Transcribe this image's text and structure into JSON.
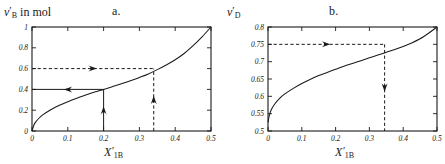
{
  "figure": {
    "width": 445,
    "height": 164,
    "background": "#ffffff",
    "line_color": "#1a1a1a"
  },
  "panels": [
    {
      "letter": "a.",
      "ylabel_symbol": "ν",
      "ylabel_sub": "B",
      "ylabel_suffix": " in mol",
      "xlabel_symbol": "X",
      "xlabel_sub": "1B"
    },
    {
      "letter": "b.",
      "ylabel_symbol": "ν",
      "ylabel_sub": "D",
      "ylabel_suffix": "",
      "xlabel_symbol": "X",
      "xlabel_sub": "1B"
    }
  ],
  "chart_data": [
    {
      "type": "line",
      "title": "a.",
      "xlabel": "X'_1B",
      "ylabel": "ν'_B in mol",
      "xlim": [
        0,
        0.5
      ],
      "ylim": [
        0,
        1
      ],
      "xticks": [
        0,
        0.1,
        0.2,
        0.3,
        0.4,
        0.5
      ],
      "xticklabels": [
        "0",
        "0.1",
        "0.2",
        "0.3",
        "0.4",
        "0.5"
      ],
      "yticks": [
        0,
        0.2,
        0.4,
        0.6,
        0.8,
        1
      ],
      "yticklabels": [
        "0",
        "0.2",
        "0.4",
        "0.6",
        "0.8",
        "1"
      ],
      "grid": false,
      "legend": false,
      "series": [
        {
          "name": "nu_B",
          "x": [
            0.0,
            0.005,
            0.01,
            0.02,
            0.03,
            0.05,
            0.075,
            0.1,
            0.125,
            0.15,
            0.175,
            0.2,
            0.225,
            0.25,
            0.275,
            0.3,
            0.325,
            0.35,
            0.375,
            0.4,
            0.425,
            0.45,
            0.475,
            0.5
          ],
          "y": [
            0.0,
            0.055,
            0.085,
            0.125,
            0.155,
            0.2,
            0.245,
            0.282,
            0.315,
            0.345,
            0.374,
            0.4,
            0.427,
            0.455,
            0.484,
            0.515,
            0.549,
            0.59,
            0.635,
            0.685,
            0.745,
            0.82,
            0.905,
            1.0
          ]
        }
      ],
      "annotations": [
        {
          "kind": "h-arrow",
          "style": "solid",
          "y": 0.4,
          "x_from": 0.2,
          "x_to": 0.0,
          "direction": "left"
        },
        {
          "kind": "v-arrow",
          "style": "solid",
          "x": 0.2,
          "y_from": 0.0,
          "y_to": 0.4,
          "direction": "up"
        },
        {
          "kind": "h-arrow",
          "style": "dashed",
          "y": 0.6,
          "x_from": 0.0,
          "x_to": 0.34,
          "direction": "right"
        },
        {
          "kind": "v-arrow",
          "style": "dashed",
          "x": 0.34,
          "y_from": 0.0,
          "y_to": 0.6,
          "direction": "up"
        }
      ]
    },
    {
      "type": "line",
      "title": "b.",
      "xlabel": "X'_1B",
      "ylabel": "ν'_D",
      "xlim": [
        0,
        0.5
      ],
      "ylim": [
        0.5,
        0.8
      ],
      "xticks": [
        0,
        0.1,
        0.2,
        0.3,
        0.4,
        0.5
      ],
      "xticklabels": [
        "0",
        "0.1",
        "0.2",
        "0.3",
        "0.4",
        "0.5"
      ],
      "yticks": [
        0.5,
        0.55,
        0.6,
        0.65,
        0.7,
        0.75,
        0.8
      ],
      "yticklabels": [
        "0.5",
        "0.55",
        "0.6",
        "0.65",
        "0.7",
        "0.75",
        "0.8"
      ],
      "grid": false,
      "legend": false,
      "series": [
        {
          "name": "nu_D",
          "x": [
            0.0,
            0.004,
            0.01,
            0.02,
            0.035,
            0.05,
            0.075,
            0.1,
            0.125,
            0.15,
            0.175,
            0.2,
            0.225,
            0.25,
            0.275,
            0.3,
            0.325,
            0.35,
            0.375,
            0.4,
            0.425,
            0.45,
            0.475,
            0.5
          ],
          "y": [
            0.525,
            0.545,
            0.562,
            0.578,
            0.595,
            0.607,
            0.623,
            0.637,
            0.649,
            0.66,
            0.669,
            0.678,
            0.687,
            0.695,
            0.703,
            0.711,
            0.719,
            0.727,
            0.735,
            0.744,
            0.754,
            0.766,
            0.782,
            0.8
          ]
        }
      ],
      "annotations": [
        {
          "kind": "h-arrow",
          "style": "dashed",
          "y": 0.75,
          "x_from": 0.0,
          "x_to": 0.345,
          "direction": "right"
        },
        {
          "kind": "v-arrow",
          "style": "dashed",
          "x": 0.345,
          "y_from": 0.75,
          "y_to": 0.5,
          "direction": "down"
        }
      ]
    }
  ]
}
